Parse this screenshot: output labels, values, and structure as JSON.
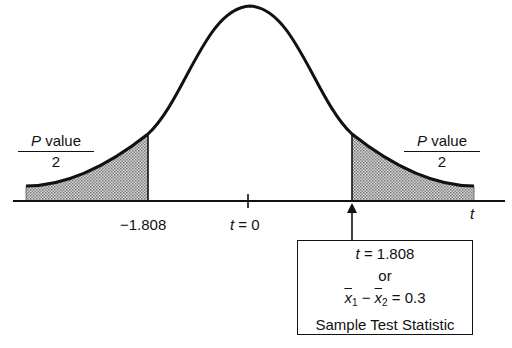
{
  "diagram": {
    "type": "two-tailed t distribution with shaded p-value tails",
    "axis_label": "t",
    "center_tick_label": "t = 0",
    "left_critical_value": "−1.808",
    "left_tail_label": {
      "numerator_var": "P",
      "numerator_text": "value",
      "denominator": "2"
    },
    "right_tail_label": {
      "numerator_var": "P",
      "numerator_text": "value",
      "denominator": "2"
    },
    "callout": {
      "line1_var": "t",
      "line1_rest": " = 1.808",
      "line2": "or",
      "line3_x1": "x",
      "line3_sub1": "1",
      "line3_minus": " − ",
      "line3_x2": "x",
      "line3_sub2": "2",
      "line3_rest": " = 0.3",
      "line4": "Sample Test Statistic"
    },
    "colors": {
      "line": "#111111",
      "shade": "#9a9a9a",
      "background": "#ffffff"
    }
  }
}
